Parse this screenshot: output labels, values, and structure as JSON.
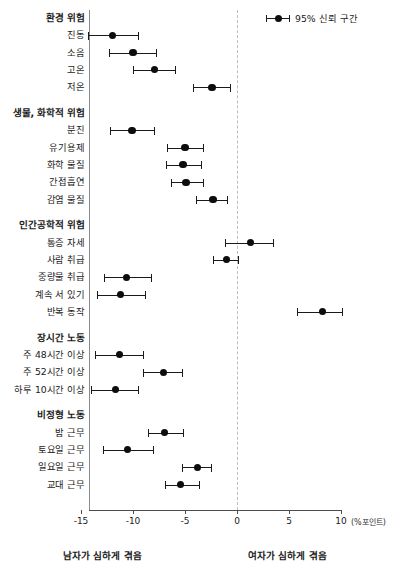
{
  "legend": {
    "label": "95% 신뢰 구간",
    "marker_name": "confidence-interval-marker"
  },
  "axis": {
    "unit": "(%포인트)",
    "ticks": [
      -15,
      -10,
      -5,
      0,
      5,
      10
    ],
    "tick_labels": [
      "-15",
      "-10",
      "-5",
      "0",
      "5",
      "10"
    ]
  },
  "footnotes": {
    "left": "남자가 심하게 겪음",
    "right": "여자가 심하게 겪음"
  },
  "chart_data": {
    "type": "scatter",
    "title": "",
    "xlabel": "(%포인트)",
    "ylabel": "",
    "xlim": [
      -16,
      10.5
    ],
    "grid": false,
    "legend": [
      "95% 신뢰 구간"
    ],
    "legend_position": "top-right",
    "annotations": [
      "남자가 심하게 겪음",
      "여자가 심하게 겪음"
    ],
    "reference_line": 0,
    "groups": [
      {
        "name": "환경 위험",
        "items": [
          {
            "label": "진동",
            "estimate": -12.0,
            "low": -14.3,
            "high": -9.5
          },
          {
            "label": "소음",
            "estimate": -10.0,
            "low": -12.3,
            "high": -7.8
          },
          {
            "label": "고온",
            "estimate": -7.9,
            "low": -10.0,
            "high": -6.0
          },
          {
            "label": "저온",
            "estimate": -2.4,
            "low": -4.2,
            "high": -0.7
          }
        ]
      },
      {
        "name": "생물, 화학적 위험",
        "items": [
          {
            "label": "분진",
            "estimate": -10.1,
            "low": -12.2,
            "high": -8.0
          },
          {
            "label": "유기용제",
            "estimate": -5.0,
            "low": -6.7,
            "high": -3.3
          },
          {
            "label": "화학 물질",
            "estimate": -5.2,
            "low": -6.8,
            "high": -3.5
          },
          {
            "label": "간접흡연",
            "estimate": -4.9,
            "low": -6.3,
            "high": -3.3
          },
          {
            "label": "감염 물질",
            "estimate": -2.3,
            "low": -3.9,
            "high": -1.0
          }
        ]
      },
      {
        "name": "인간공학적 위험",
        "items": [
          {
            "label": "통증 자세",
            "estimate": 1.3,
            "low": -1.2,
            "high": 3.5
          },
          {
            "label": "사람 취급",
            "estimate": -1.0,
            "low": -2.3,
            "high": 0.1
          },
          {
            "label": "중량물 취급",
            "estimate": -10.6,
            "low": -12.8,
            "high": -8.3
          },
          {
            "label": "계속 서 있기",
            "estimate": -11.2,
            "low": -13.5,
            "high": -8.8
          },
          {
            "label": "반복 동작",
            "estimate": 8.2,
            "low": 5.8,
            "high": 10.1
          }
        ]
      },
      {
        "name": "장시간 노동",
        "items": [
          {
            "label": "주 48시간 이상",
            "estimate": -11.3,
            "low": -13.7,
            "high": -9.0
          },
          {
            "label": "주 52시간 이상",
            "estimate": -7.1,
            "low": -9.0,
            "high": -5.3
          },
          {
            "label": "하루 10시간 이상",
            "estimate": -11.7,
            "low": -14.0,
            "high": -9.5
          }
        ]
      },
      {
        "name": "비정형 노동",
        "items": [
          {
            "label": "밤 근무",
            "estimate": -7.0,
            "low": -8.6,
            "high": -5.2
          },
          {
            "label": "토요일 근무",
            "estimate": -10.5,
            "low": -12.9,
            "high": -8.1
          },
          {
            "label": "일요일 근무",
            "estimate": -3.8,
            "low": -5.3,
            "high": -2.5
          },
          {
            "label": "교대 근무",
            "estimate": -5.4,
            "low": -6.9,
            "high": -3.7
          }
        ]
      }
    ]
  }
}
